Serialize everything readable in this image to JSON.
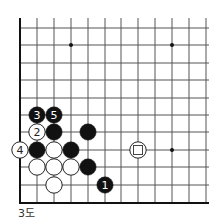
{
  "diagram": {
    "caption": "3도",
    "grid": {
      "columns_x": [
        20,
        37,
        54,
        71,
        88,
        105,
        121,
        138,
        155,
        172,
        189,
        206
      ],
      "rows_y": [
        28,
        45,
        63,
        80,
        98,
        115,
        132,
        150,
        167,
        185,
        203
      ],
      "top_open_y": 18,
      "right_open_x": 209,
      "left_edge": true,
      "bottom_edge": true,
      "line_color": "#555555",
      "edge_color": "#111111"
    },
    "star_points": [
      {
        "col": 3,
        "row": 1
      },
      {
        "col": 9,
        "row": 1
      },
      {
        "col": 9,
        "row": 7
      }
    ],
    "stones": [
      {
        "color": "black",
        "col": 5,
        "row": 9,
        "label": "1"
      },
      {
        "color": "white",
        "col": 1,
        "row": 6,
        "label": "2"
      },
      {
        "color": "black",
        "col": 1,
        "row": 5,
        "label": "3"
      },
      {
        "color": "white",
        "col": 0,
        "row": 7,
        "label": "4"
      },
      {
        "color": "black",
        "col": 2,
        "row": 5,
        "label": "5"
      },
      {
        "color": "black",
        "col": 2,
        "row": 6,
        "label": ""
      },
      {
        "color": "black",
        "col": 4,
        "row": 6,
        "label": ""
      },
      {
        "color": "black",
        "col": 1,
        "row": 7,
        "label": ""
      },
      {
        "color": "white",
        "col": 2,
        "row": 7,
        "label": ""
      },
      {
        "color": "black",
        "col": 3,
        "row": 7,
        "label": ""
      },
      {
        "color": "white",
        "col": 1,
        "row": 8,
        "label": ""
      },
      {
        "color": "white",
        "col": 2,
        "row": 8,
        "label": ""
      },
      {
        "color": "white",
        "col": 3,
        "row": 8,
        "label": ""
      },
      {
        "color": "black",
        "col": 4,
        "row": 8,
        "label": ""
      },
      {
        "color": "white",
        "col": 2,
        "row": 9,
        "label": ""
      },
      {
        "color": "white",
        "col": 7,
        "row": 7,
        "label": "",
        "marker": "square"
      }
    ],
    "colors": {
      "black_stone": "#111111",
      "white_stone": "#ffffff",
      "stone_outline": "#222222",
      "black_label": "#ffffff",
      "white_label": "#222222"
    }
  }
}
